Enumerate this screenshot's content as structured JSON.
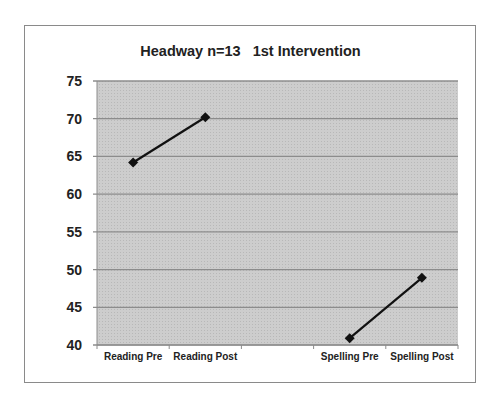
{
  "chart_data": {
    "type": "line",
    "title": "Headway n=13   1st Intervention",
    "xlabel": "",
    "ylabel": "",
    "categories": [
      "Reading Pre",
      "Reading Post",
      "",
      "Spelling Pre",
      "Spelling Post"
    ],
    "series": [
      {
        "name": "Reading",
        "x": [
          "Reading Pre",
          "Reading Post"
        ],
        "values": [
          64.2,
          70.2
        ]
      },
      {
        "name": "Spelling",
        "x": [
          "Spelling Pre",
          "Spelling Post"
        ],
        "values": [
          40.9,
          48.9
        ]
      }
    ],
    "ylim": [
      40,
      75
    ],
    "yticks": [
      40,
      45,
      50,
      55,
      60,
      65,
      70,
      75
    ],
    "grid": true,
    "legend": "none",
    "marker": "diamond",
    "colors": {
      "line": "#111111",
      "plot_bg": "#c8c8c8",
      "grid": "#8c8c8c"
    }
  }
}
